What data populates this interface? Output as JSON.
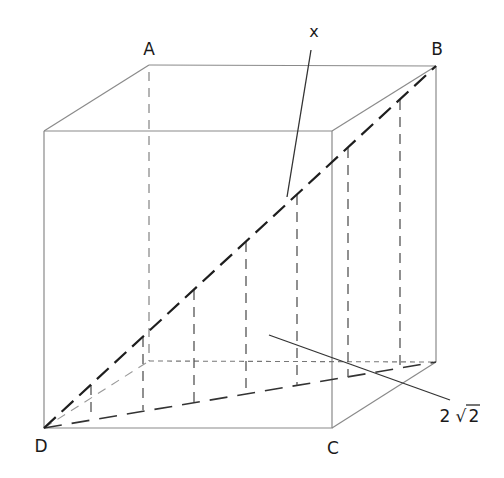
{
  "figure": {
    "type": "cube-space-diagonal",
    "vertices": {
      "A": {
        "label": "A"
      },
      "B": {
        "label": "B"
      },
      "C": {
        "label": "C"
      },
      "D": {
        "label": "D"
      }
    },
    "annotations": {
      "space_diagonal": {
        "label": "x"
      },
      "base_diagonal": {
        "label_number": "2",
        "label_radical": "√",
        "label_radicand": "2",
        "label": "2√2"
      }
    },
    "colors": {
      "edge": "#8a8a8a",
      "diagonal": "#1e1e1e",
      "text": "#1a1a1a"
    }
  }
}
